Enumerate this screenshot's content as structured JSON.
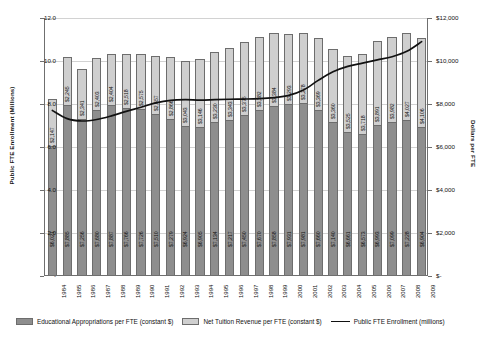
{
  "axes": {
    "y_left_title": "Public FTE Enrollment (Millions)",
    "y_right_title": "Dollars per FTE",
    "y_left_ticks": [
      "12.0",
      "10.0",
      "8.0",
      "6.0",
      "4.0",
      "2.0",
      "-"
    ],
    "y_right_ticks": [
      "$12,000",
      "$10,000",
      "$8,000",
      "$6,000",
      "$4,000",
      "$2,000",
      "$-"
    ]
  },
  "legend": {
    "appropriations": "Educational Appropriations per FTE (constant $)",
    "tuition": "Net Tuition Revenue per FTE (constant $)",
    "enrollment": "Public FTE Enrollment (millions)"
  },
  "colors": {
    "appropriations": "#8e8e8e",
    "tuition": "#cfcfcf",
    "line": "#111111",
    "grid": "#d2d2d2",
    "axis": "#6f6f6f"
  },
  "chart_data": {
    "type": "bar",
    "title": "",
    "xlabel": "",
    "ylabel": "Public FTE Enrollment (Millions)",
    "y2label": "Dollars per FTE",
    "ylim": [
      0,
      12
    ],
    "y2lim": [
      0,
      12000
    ],
    "grid": true,
    "legend_position": "bottom",
    "stacked": true,
    "categories": [
      "1984",
      "1985",
      "1986",
      "1987",
      "1988",
      "1989",
      "1990",
      "1991",
      "1992",
      "1993",
      "1994",
      "1995",
      "1996",
      "1997",
      "1998",
      "1999",
      "2000",
      "2001",
      "2002",
      "2003",
      "2004",
      "2005",
      "2006",
      "2007",
      "2008",
      "2009"
    ],
    "series": [
      {
        "name": "Educational Appropriations per FTE (constant $)",
        "axis": "y2",
        "values": [
          6021,
          7885,
          7256,
          7680,
          7887,
          7766,
          7726,
          7510,
          7279,
          6924,
          6905,
          7134,
          7217,
          7450,
          7670,
          7858,
          7931,
          7981,
          7660,
          7140,
          6661,
          6573,
          6993,
          7099,
          7228,
          6904
        ],
        "labels": [
          "$6,021",
          "$7,885",
          "$7,256",
          "$7,680",
          "$7,887",
          "$7,766",
          "$7,726",
          "$7,510",
          "$7,279",
          "$6,924",
          "$6,905",
          "$7,134",
          "$7,217",
          "$7,450",
          "$7,670",
          "$7,858",
          "$7,931",
          "$7,981",
          "$7,660",
          "$7,140",
          "$6,661",
          "$6,573",
          "$6,993",
          "$7,099",
          "$7,228",
          "$6,904"
        ]
      },
      {
        "name": "Net Tuition Revenue per FTE (constant $)",
        "axis": "y2",
        "values": [
          2147,
          2245,
          2341,
          2403,
          2404,
          2518,
          2575,
          2657,
          2866,
          3043,
          3146,
          3230,
          3343,
          3375,
          3382,
          3384,
          3293,
          3278,
          3369,
          3360,
          3525,
          3718,
          3891,
          3982,
          4027,
          4106
        ],
        "labels": [
          "$2,147",
          "$2,245",
          "$2,341",
          "$2,403",
          "$2,404",
          "$2,518",
          "$2,575",
          "$2,657",
          "$2,866",
          "$3,043",
          "$3,146",
          "$3,230",
          "$3,343",
          "$3,375",
          "$3,382",
          "$3,384",
          "$3,293",
          "$3,278",
          "$3,369",
          "$3,360",
          "$3,525",
          "$3,718",
          "$3,891",
          "$3,982",
          "$4,027",
          "$4,106"
        ]
      },
      {
        "name": "Public FTE Enrollment (millions)",
        "type": "line",
        "axis": "y1",
        "values": [
          7.7,
          7.32,
          7.21,
          7.28,
          7.45,
          7.66,
          7.85,
          8.05,
          8.17,
          8.2,
          8.18,
          8.2,
          8.22,
          8.23,
          8.25,
          8.3,
          8.4,
          8.65,
          9.1,
          9.5,
          9.75,
          9.9,
          10.05,
          10.2,
          10.45,
          10.9
        ]
      }
    ]
  }
}
